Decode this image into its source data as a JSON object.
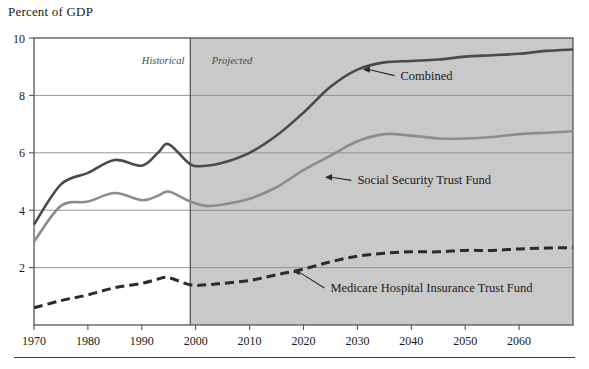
{
  "figure": {
    "axis_title": "Percent of GDP",
    "era_historical": "Historical",
    "era_projected": "Projected"
  },
  "labels": {
    "combined": "Combined",
    "social_security": "Social Security Trust Fund",
    "medicare": "Medicare Hospital Insurance Trust Fund"
  },
  "colors": {
    "combined": "#4a4a4a",
    "social_security": "#8c8c8c",
    "medicare": "#2b2b2b",
    "projected_shading": "#c9c9c9",
    "frame": "#555555",
    "gridline": "#8a8a8a"
  },
  "ticks": {
    "y": [
      "10",
      "8",
      "6",
      "4",
      "2"
    ],
    "x": [
      "1970",
      "1980",
      "1990",
      "2000",
      "2010",
      "2020",
      "2030",
      "2040",
      "2050",
      "2060"
    ]
  },
  "chart_data": {
    "type": "line",
    "title": "",
    "xlabel": "",
    "ylabel": "Percent of GDP",
    "xlim": [
      1970,
      2070
    ],
    "ylim": [
      0,
      10
    ],
    "yticks": [
      2,
      4,
      6,
      8,
      10
    ],
    "xticks": [
      1970,
      1980,
      1990,
      2000,
      2010,
      2020,
      2030,
      2040,
      2050,
      2060
    ],
    "grid": "horizontal",
    "legend": "inline-annotations",
    "historical_span": [
      1970,
      1999
    ],
    "projected_span": [
      1999,
      2070
    ],
    "annotations": [
      {
        "text": "Historical",
        "x": 1990,
        "y": 9.1,
        "style": "italic"
      },
      {
        "text": "Projected",
        "x": 2003,
        "y": 9.1,
        "style": "italic"
      },
      {
        "text": "Combined",
        "x": 2038,
        "y": 8.55,
        "arrow_to": [
          2031,
          8.9
        ]
      },
      {
        "text": "Social Security Trust Fund",
        "x": 2030,
        "y": 4.9,
        "arrow_to": [
          2024,
          5.15
        ]
      },
      {
        "text": "Medicare Hospital Insurance Trust Fund",
        "x": 2025,
        "y": 1.15,
        "arrow_to": [
          2018,
          1.85
        ]
      }
    ],
    "series": [
      {
        "name": "Combined",
        "style": "solid",
        "color": "#4a4a4a",
        "x": [
          1970,
          1975,
          1980,
          1985,
          1990,
          1993,
          1995,
          1999,
          2002,
          2005,
          2010,
          2015,
          2020,
          2025,
          2030,
          2035,
          2040,
          2045,
          2050,
          2055,
          2060,
          2065,
          2070
        ],
        "values": [
          3.5,
          4.9,
          5.3,
          5.75,
          5.55,
          6.0,
          6.3,
          5.6,
          5.55,
          5.65,
          6.0,
          6.6,
          7.4,
          8.3,
          8.9,
          9.15,
          9.2,
          9.25,
          9.35,
          9.4,
          9.45,
          9.55,
          9.6
        ]
      },
      {
        "name": "Social Security Trust Fund",
        "style": "solid",
        "color": "#8c8c8c",
        "x": [
          1970,
          1975,
          1980,
          1985,
          1990,
          1993,
          1995,
          1999,
          2002,
          2005,
          2010,
          2015,
          2020,
          2025,
          2030,
          2035,
          2040,
          2045,
          2050,
          2055,
          2060,
          2065,
          2070
        ],
        "values": [
          2.9,
          4.15,
          4.3,
          4.6,
          4.35,
          4.5,
          4.65,
          4.3,
          4.15,
          4.2,
          4.4,
          4.8,
          5.4,
          5.9,
          6.4,
          6.65,
          6.6,
          6.5,
          6.5,
          6.55,
          6.65,
          6.7,
          6.75
        ]
      },
      {
        "name": "Medicare Hospital Insurance Trust Fund",
        "style": "dashed",
        "color": "#2b2b2b",
        "x": [
          1970,
          1975,
          1980,
          1985,
          1990,
          1993,
          1995,
          1999,
          2002,
          2005,
          2010,
          2015,
          2020,
          2025,
          2030,
          2035,
          2040,
          2045,
          2050,
          2055,
          2060,
          2065,
          2070
        ],
        "values": [
          0.6,
          0.85,
          1.05,
          1.3,
          1.45,
          1.6,
          1.65,
          1.4,
          1.4,
          1.45,
          1.55,
          1.75,
          1.95,
          2.2,
          2.4,
          2.5,
          2.55,
          2.55,
          2.6,
          2.6,
          2.65,
          2.68,
          2.7
        ]
      }
    ]
  }
}
